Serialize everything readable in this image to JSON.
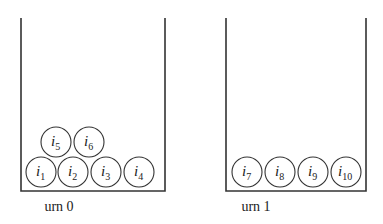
{
  "urns": [
    {
      "label": "urn 0",
      "walls": {
        "left": 21,
        "right": 165,
        "top": 18,
        "bottom": 191
      },
      "label_x": 59,
      "balls": [
        {
          "name": "i",
          "sub": "1",
          "cx": 41,
          "cy": 172
        },
        {
          "name": "i",
          "sub": "2",
          "cx": 73,
          "cy": 172
        },
        {
          "name": "i",
          "sub": "3",
          "cx": 106,
          "cy": 172
        },
        {
          "name": "i",
          "sub": "4",
          "cx": 139,
          "cy": 172
        },
        {
          "name": "i",
          "sub": "5",
          "cx": 56,
          "cy": 142
        },
        {
          "name": "i",
          "sub": "6",
          "cx": 89,
          "cy": 142
        }
      ]
    },
    {
      "label": "urn 1",
      "walls": {
        "left": 226,
        "right": 366,
        "top": 18,
        "bottom": 191
      },
      "label_x": 256,
      "balls": [
        {
          "name": "i",
          "sub": "7",
          "cx": 247,
          "cy": 172
        },
        {
          "name": "i",
          "sub": "8",
          "cx": 280,
          "cy": 172
        },
        {
          "name": "i",
          "sub": "9",
          "cx": 313,
          "cy": 172
        },
        {
          "name": "i",
          "sub": "10",
          "cx": 346,
          "cy": 172
        }
      ]
    }
  ],
  "ball_radius": 15,
  "stroke_color": "#333333"
}
